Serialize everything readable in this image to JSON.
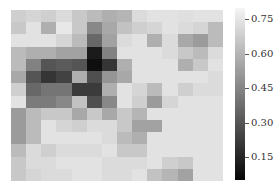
{
  "chart_data": {
    "type": "heatmap",
    "title": "",
    "xlabel": "",
    "ylabel": "",
    "rows": 14,
    "cols": 14,
    "colormap": "gray",
    "vmin": 0.05,
    "vmax": 0.8,
    "values": [
      [
        0.68,
        0.7,
        0.68,
        0.72,
        0.66,
        0.62,
        0.58,
        0.6,
        0.72,
        0.74,
        0.74,
        0.73,
        0.74,
        0.74
      ],
      [
        0.66,
        0.74,
        0.58,
        0.76,
        0.66,
        0.46,
        0.56,
        0.64,
        0.68,
        0.7,
        0.74,
        0.72,
        0.7,
        0.62
      ],
      [
        0.74,
        0.74,
        0.74,
        0.7,
        0.62,
        0.36,
        0.54,
        0.72,
        0.74,
        0.58,
        0.72,
        0.56,
        0.52,
        0.62
      ],
      [
        0.62,
        0.58,
        0.58,
        0.54,
        0.54,
        0.12,
        0.44,
        0.74,
        0.74,
        0.74,
        0.72,
        0.66,
        0.62,
        0.72
      ],
      [
        0.62,
        0.44,
        0.3,
        0.32,
        0.3,
        0.08,
        0.2,
        0.58,
        0.74,
        0.74,
        0.74,
        0.58,
        0.66,
        0.74
      ],
      [
        0.56,
        0.3,
        0.2,
        0.24,
        0.58,
        0.28,
        0.5,
        0.56,
        0.74,
        0.74,
        0.74,
        0.74,
        0.74,
        0.72
      ],
      [
        0.68,
        0.36,
        0.4,
        0.4,
        0.22,
        0.22,
        0.58,
        0.74,
        0.7,
        0.62,
        0.74,
        0.68,
        0.72,
        0.72
      ],
      [
        0.74,
        0.42,
        0.42,
        0.46,
        0.64,
        0.28,
        0.46,
        0.74,
        0.68,
        0.52,
        0.7,
        0.74,
        0.74,
        0.74
      ],
      [
        0.52,
        0.62,
        0.66,
        0.66,
        0.56,
        0.66,
        0.56,
        0.66,
        0.6,
        0.74,
        0.74,
        0.74,
        0.74,
        0.74
      ],
      [
        0.52,
        0.62,
        0.74,
        0.7,
        0.68,
        0.72,
        0.72,
        0.66,
        0.54,
        0.54,
        0.74,
        0.74,
        0.74,
        0.74
      ],
      [
        0.52,
        0.62,
        0.74,
        0.74,
        0.74,
        0.74,
        0.72,
        0.62,
        0.58,
        0.74,
        0.74,
        0.74,
        0.74,
        0.74
      ],
      [
        0.62,
        0.72,
        0.68,
        0.72,
        0.72,
        0.72,
        0.74,
        0.66,
        0.66,
        0.74,
        0.74,
        0.74,
        0.74,
        0.74
      ],
      [
        0.66,
        0.72,
        0.72,
        0.74,
        0.74,
        0.74,
        0.72,
        0.72,
        0.72,
        0.74,
        0.68,
        0.66,
        0.74,
        0.74
      ],
      [
        0.66,
        0.7,
        0.72,
        0.72,
        0.74,
        0.74,
        0.72,
        0.72,
        0.74,
        0.64,
        0.6,
        0.54,
        0.74,
        0.74
      ]
    ],
    "colorbar": {
      "ticks": [
        0.15,
        0.3,
        0.45,
        0.6,
        0.75
      ],
      "tick_labels": [
        "0.15",
        "0.30",
        "0.45",
        "0.60",
        "0.75"
      ]
    },
    "x_tick_labels": [],
    "y_tick_labels": [],
    "grid": false
  }
}
